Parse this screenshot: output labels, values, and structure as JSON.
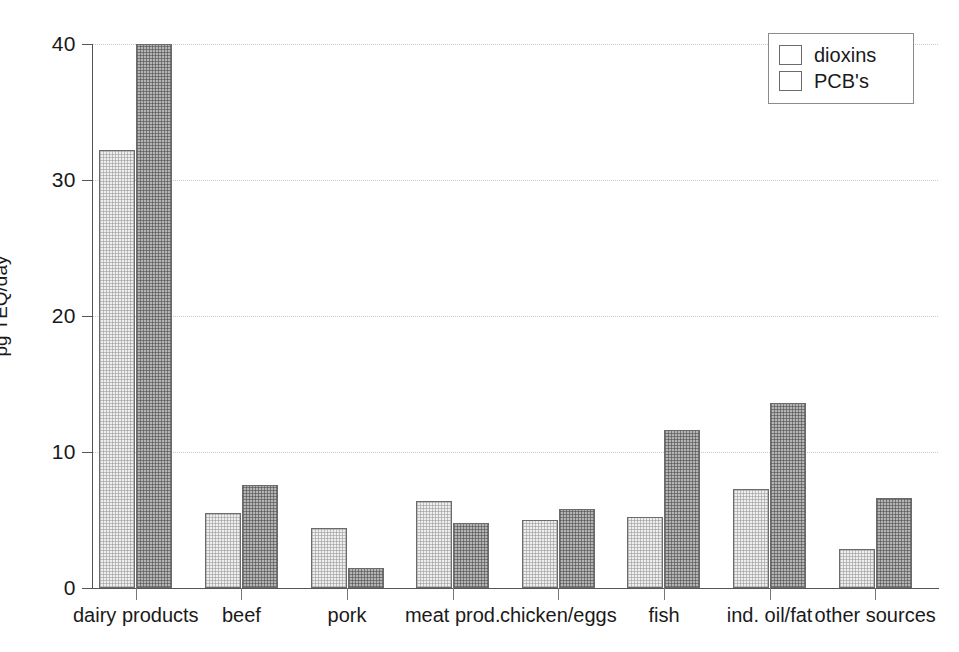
{
  "chart_data": {
    "type": "bar",
    "title": "",
    "xlabel": "",
    "ylabel": "pg TEQ/day",
    "ylim": [
      0,
      40
    ],
    "yticks": [
      0,
      10,
      20,
      30,
      40
    ],
    "grid": true,
    "legend_position": "top-right",
    "categories": [
      "dairy products",
      "beef",
      "pork",
      "meat prod.",
      "chicken/eggs",
      "fish",
      "ind. oil/fat",
      "other sources"
    ],
    "series": [
      {
        "name": "dioxins",
        "color": "#eeeeee",
        "values": [
          32.2,
          5.5,
          4.4,
          6.4,
          5.0,
          5.2,
          7.3,
          2.9
        ]
      },
      {
        "name": "PCB's",
        "color": "#b4b4b4",
        "values": [
          40.0,
          7.6,
          1.5,
          4.8,
          5.8,
          11.6,
          13.6,
          6.6
        ]
      }
    ]
  },
  "legend": {
    "entries": [
      {
        "label": "dioxins",
        "swatch": "series-dioxins"
      },
      {
        "label": "PCB's",
        "swatch": "series-pcbs"
      }
    ]
  }
}
